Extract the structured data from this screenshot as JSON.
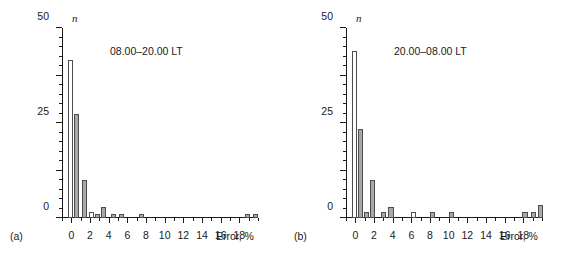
{
  "figure": {
    "background": "#ffffff",
    "axis_color": "#1a1a1a",
    "bar_fill": "#a8a8a8",
    "bar_empty_fill": "#ffffff",
    "bar_edge": "#4d4d4d"
  },
  "chart_data": [
    {
      "type": "bar",
      "panel_tag": "(a)",
      "title": "08.00–20.00 LT",
      "xlabel": "Error, %",
      "ylabel": "n",
      "xlim": [
        -1,
        20
      ],
      "ylim": [
        0,
        100
      ],
      "grid": false,
      "legend": "none",
      "x_major_ticks": [
        0,
        2,
        4,
        6,
        8,
        10,
        12,
        14,
        16,
        18
      ],
      "x_major_tick_labels": [
        "0",
        "2",
        "4",
        "6",
        "8",
        "10",
        "12",
        "14",
        "16",
        "18"
      ],
      "x_minor_tick_step": 1,
      "y_major_ticks": [
        0,
        25,
        50,
        75,
        100
      ],
      "y_major_tick_labels": [
        "0",
        "25",
        "50",
        "75",
        "100"
      ],
      "y_minor_tick_step": 5,
      "bar_width": 0.55,
      "bars": [
        {
          "x": -0.35,
          "value": 83,
          "filled": false
        },
        {
          "x": 0.3,
          "value": 55,
          "filled": true
        },
        {
          "x": 1.15,
          "value": 20,
          "filled": true
        },
        {
          "x": 1.9,
          "value": 3,
          "filled": false
        },
        {
          "x": 2.5,
          "value": 2,
          "filled": true
        },
        {
          "x": 3.15,
          "value": 6,
          "filled": true
        },
        {
          "x": 4.2,
          "value": 2,
          "filled": true
        },
        {
          "x": 5.1,
          "value": 2,
          "filled": true
        },
        {
          "x": 7.25,
          "value": 2,
          "filled": true
        },
        {
          "x": 18.6,
          "value": 2,
          "filled": true
        },
        {
          "x": 19.5,
          "value": 2,
          "filled": true
        }
      ]
    },
    {
      "type": "bar",
      "panel_tag": "(b)",
      "title": "20.00–08.00 LT",
      "xlabel": "Error, %",
      "ylabel": "n",
      "xlim": [
        -1,
        20
      ],
      "ylim": [
        0,
        100
      ],
      "grid": false,
      "legend": "none",
      "x_major_ticks": [
        0,
        2,
        4,
        6,
        8,
        10,
        12,
        14,
        16,
        18
      ],
      "x_major_tick_labels": [
        "0",
        "2",
        "4",
        "6",
        "8",
        "10",
        "12",
        "14",
        "16",
        "18"
      ],
      "x_minor_tick_step": 1,
      "y_major_ticks": [
        0,
        25,
        50,
        75,
        100
      ],
      "y_major_tick_labels": [
        "0",
        "25",
        "50",
        "75",
        "100"
      ],
      "y_minor_tick_step": 5,
      "bar_width": 0.55,
      "bars": [
        {
          "x": -0.35,
          "value": 88,
          "filled": false
        },
        {
          "x": 0.3,
          "value": 47,
          "filled": true
        },
        {
          "x": 0.95,
          "value": 3,
          "filled": true
        },
        {
          "x": 1.6,
          "value": 20,
          "filled": true
        },
        {
          "x": 2.7,
          "value": 3,
          "filled": true
        },
        {
          "x": 3.55,
          "value": 6,
          "filled": true
        },
        {
          "x": 6.0,
          "value": 3,
          "filled": false
        },
        {
          "x": 8.0,
          "value": 3,
          "filled": true
        },
        {
          "x": 10.0,
          "value": 3,
          "filled": true
        },
        {
          "x": 17.9,
          "value": 3,
          "filled": true
        },
        {
          "x": 18.8,
          "value": 3,
          "filled": true
        },
        {
          "x": 19.6,
          "value": 7,
          "filled": true
        }
      ]
    }
  ]
}
